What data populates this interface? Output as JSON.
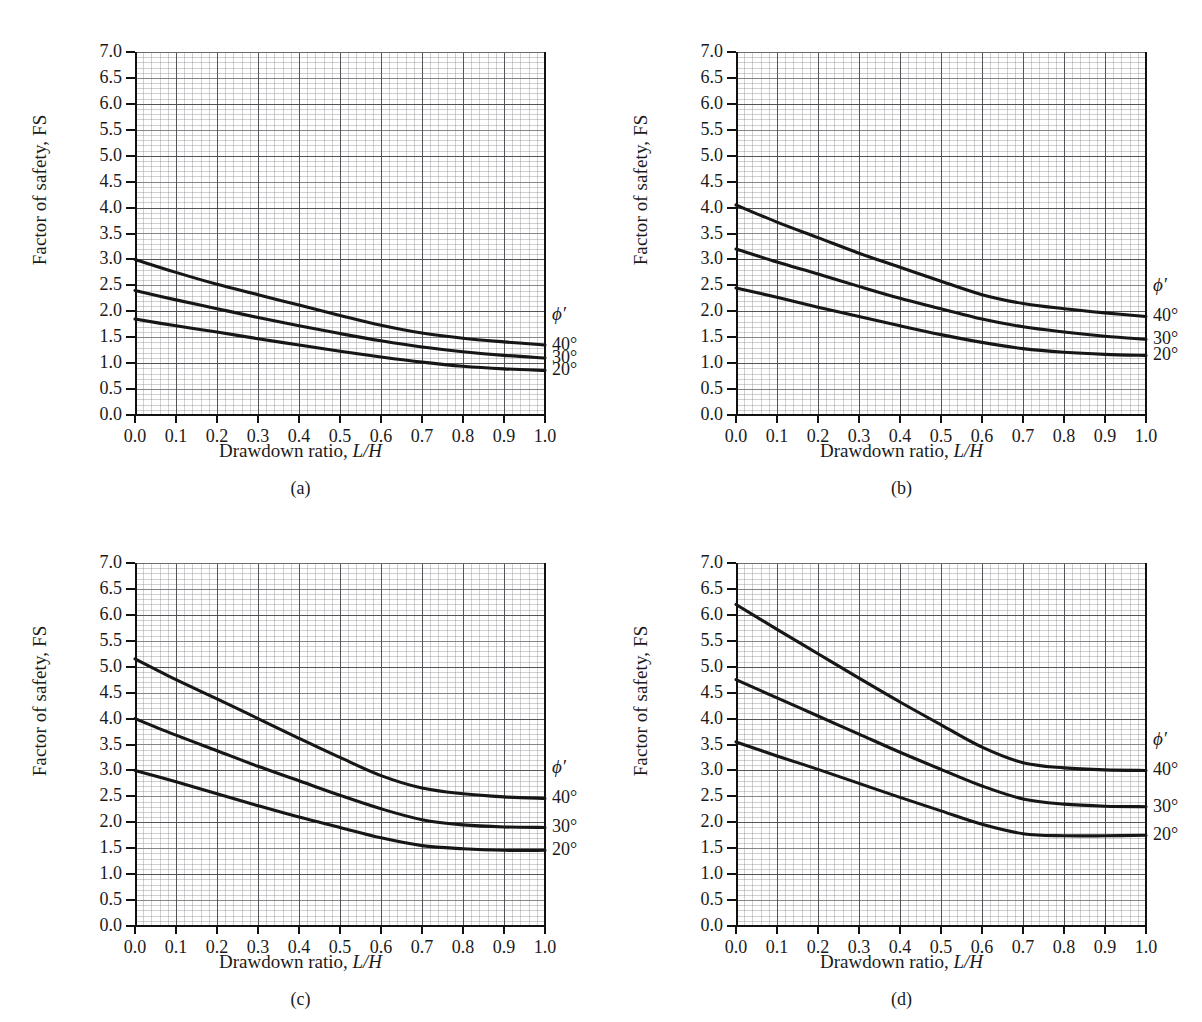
{
  "figure": {
    "layout": "2x2",
    "panels": [
      "a",
      "b",
      "c",
      "d"
    ]
  },
  "axis": {
    "ylabel": "Factor of safety, FS",
    "xlabel_text": "Drawdown ratio, ",
    "xlabel_italic": "L/H",
    "yticks": [
      "0.0",
      "0.5",
      "1.0",
      "1.5",
      "2.0",
      "2.5",
      "3.0",
      "3.5",
      "4.0",
      "4.5",
      "5.0",
      "5.5",
      "6.0",
      "6.5",
      "7.0"
    ],
    "xticks": [
      "0.0",
      "0.1",
      "0.2",
      "0.3",
      "0.4",
      "0.5",
      "0.6",
      "0.7",
      "0.8",
      "0.9",
      "1.0"
    ]
  },
  "legend": {
    "symbol": "ϕ′",
    "entries": [
      "40°",
      "30°",
      "20°"
    ]
  },
  "captions": {
    "a": "(a)",
    "b": "(b)",
    "c": "(c)",
    "d": "(d)"
  },
  "colors": {
    "curve": "#161616",
    "grid_major": "#46464b",
    "grid_minor": "#78787d",
    "frame": "#111111",
    "background": "#ffffff"
  },
  "chart_data": [
    {
      "id": "a",
      "type": "line",
      "title": "(a)",
      "xlabel": "Drawdown ratio, L/H",
      "ylabel": "Factor of safety, FS",
      "xlim": [
        0.0,
        1.0
      ],
      "ylim": [
        0.0,
        7.0
      ],
      "xtick_step": 0.1,
      "ytick_step": 0.5,
      "grid": true,
      "legend_position": "right-outside",
      "x": [
        0.0,
        0.1,
        0.2,
        0.3,
        0.4,
        0.5,
        0.6,
        0.7,
        0.8,
        0.9,
        1.0
      ],
      "series": [
        {
          "name": "40°",
          "values": [
            3.0,
            2.75,
            2.52,
            2.32,
            2.12,
            1.92,
            1.73,
            1.58,
            1.48,
            1.41,
            1.35
          ]
        },
        {
          "name": "30°",
          "values": [
            2.4,
            2.22,
            2.05,
            1.88,
            1.72,
            1.57,
            1.43,
            1.31,
            1.22,
            1.15,
            1.1
          ]
        },
        {
          "name": "20°",
          "values": [
            1.85,
            1.72,
            1.6,
            1.47,
            1.35,
            1.23,
            1.12,
            1.02,
            0.94,
            0.89,
            0.86
          ]
        }
      ]
    },
    {
      "id": "b",
      "type": "line",
      "title": "(b)",
      "xlabel": "Drawdown ratio, L/H",
      "ylabel": "Factor of safety, FS",
      "xlim": [
        0.0,
        1.0
      ],
      "ylim": [
        0.0,
        7.0
      ],
      "xtick_step": 0.1,
      "ytick_step": 0.5,
      "grid": true,
      "legend_position": "right-outside",
      "x": [
        0.0,
        0.1,
        0.2,
        0.3,
        0.4,
        0.5,
        0.6,
        0.7,
        0.8,
        0.9,
        1.0
      ],
      "series": [
        {
          "name": "40°",
          "values": [
            4.05,
            3.72,
            3.42,
            3.12,
            2.85,
            2.58,
            2.32,
            2.15,
            2.05,
            1.97,
            1.9
          ]
        },
        {
          "name": "30°",
          "values": [
            3.2,
            2.95,
            2.72,
            2.48,
            2.25,
            2.05,
            1.85,
            1.7,
            1.6,
            1.52,
            1.46
          ]
        },
        {
          "name": "20°",
          "values": [
            2.45,
            2.27,
            2.08,
            1.9,
            1.72,
            1.55,
            1.4,
            1.28,
            1.21,
            1.17,
            1.15
          ]
        }
      ]
    },
    {
      "id": "c",
      "type": "line",
      "title": "(c)",
      "xlabel": "Drawdown ratio, L/H",
      "ylabel": "Factor of safety, FS",
      "xlim": [
        0.0,
        1.0
      ],
      "ylim": [
        0.0,
        7.0
      ],
      "xtick_step": 0.1,
      "ytick_step": 0.5,
      "grid": true,
      "legend_position": "right-outside",
      "x": [
        0.0,
        0.1,
        0.2,
        0.3,
        0.4,
        0.5,
        0.6,
        0.7,
        0.8,
        0.9,
        1.0
      ],
      "series": [
        {
          "name": "40°",
          "values": [
            5.15,
            4.75,
            4.38,
            4.0,
            3.62,
            3.25,
            2.9,
            2.66,
            2.55,
            2.49,
            2.46
          ]
        },
        {
          "name": "30°",
          "values": [
            4.0,
            3.68,
            3.38,
            3.08,
            2.8,
            2.52,
            2.26,
            2.05,
            1.95,
            1.91,
            1.9
          ]
        },
        {
          "name": "20°",
          "values": [
            3.0,
            2.78,
            2.55,
            2.32,
            2.1,
            1.9,
            1.7,
            1.55,
            1.49,
            1.46,
            1.46
          ]
        }
      ]
    },
    {
      "id": "d",
      "type": "line",
      "title": "(d)",
      "xlabel": "Drawdown ratio, L/H",
      "ylabel": "Factor of safety, FS",
      "xlim": [
        0.0,
        1.0
      ],
      "ylim": [
        0.0,
        7.0
      ],
      "xtick_step": 0.1,
      "ytick_step": 0.5,
      "grid": true,
      "legend_position": "right-outside",
      "x": [
        0.0,
        0.1,
        0.2,
        0.3,
        0.4,
        0.5,
        0.6,
        0.7,
        0.8,
        0.9,
        1.0
      ],
      "series": [
        {
          "name": "40°",
          "values": [
            6.2,
            5.72,
            5.25,
            4.78,
            4.32,
            3.88,
            3.45,
            3.15,
            3.05,
            3.01,
            3.0
          ]
        },
        {
          "name": "30°",
          "values": [
            4.75,
            4.4,
            4.05,
            3.7,
            3.35,
            3.02,
            2.7,
            2.45,
            2.35,
            2.31,
            2.3
          ]
        },
        {
          "name": "20°",
          "values": [
            3.55,
            3.28,
            3.02,
            2.75,
            2.48,
            2.22,
            1.96,
            1.78,
            1.74,
            1.74,
            1.75
          ]
        }
      ]
    }
  ]
}
